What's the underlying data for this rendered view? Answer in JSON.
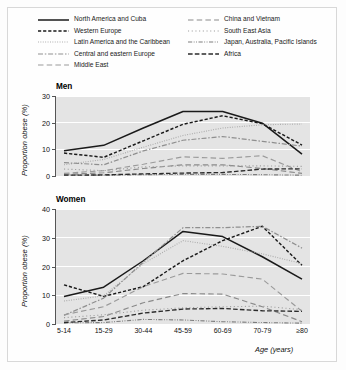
{
  "figure": {
    "background": "#fdfdfd",
    "plot_background": "#e4e4e4",
    "gridline_color": "#ffffff"
  },
  "legend": {
    "position": "top",
    "columns": [
      [
        {
          "label": "North America and Cuba",
          "style": "solid",
          "color": "#1a1a1a"
        },
        {
          "label": "Western Europe",
          "style": "dashed",
          "color": "#1a1a1a"
        },
        {
          "label": "Latin America and the Caribbean",
          "style": "dotted",
          "color": "#a9a9a9"
        },
        {
          "label": "Central and eastern Europe",
          "style": "dashdot",
          "color": "#8f8f8f"
        },
        {
          "label": "Middle East",
          "style": "longdash",
          "color": "#9a9a9a"
        }
      ],
      [
        {
          "label": "China and Vietnam",
          "style": "longdash",
          "color": "#8a8a8a"
        },
        {
          "label": "South East Asia",
          "style": "finedot",
          "color": "#9e9e9e"
        },
        {
          "label": "Japan, Australia, Pacific Islands",
          "style": "dashdotdot",
          "color": "#7d7d7d"
        },
        {
          "label": "Africa",
          "style": "dashdash",
          "color": "#2b2b2b"
        }
      ]
    ]
  },
  "chart_data": [
    {
      "type": "line",
      "title": "Men",
      "xlabel": "",
      "ylabel": "Proportion obese (%)",
      "categories": [
        "5-14",
        "15-29",
        "30-44",
        "45-59",
        "60-69",
        "70-79",
        "≥80"
      ],
      "ylim": [
        0,
        30
      ],
      "yticks": [
        0,
        10,
        20,
        30
      ],
      "grid": true,
      "series": [
        {
          "name": "North America and Cuba",
          "values": [
            9.5,
            11.5,
            18.0,
            24.2,
            24.2,
            19.8,
            8.2
          ]
        },
        {
          "name": "Western Europe",
          "values": [
            8.6,
            7.0,
            13.2,
            19.4,
            22.6,
            19.6,
            11.6
          ]
        },
        {
          "name": "Latin America and the Caribbean",
          "values": [
            4.2,
            6.2,
            10.8,
            15.2,
            18.0,
            19.2,
            19.5
          ]
        },
        {
          "name": "Central and eastern Europe",
          "values": [
            5.0,
            4.2,
            9.4,
            13.4,
            14.8,
            13.0,
            11.2
          ]
        },
        {
          "name": "Middle East",
          "values": [
            1.0,
            2.0,
            4.4,
            7.2,
            6.6,
            7.6,
            1.6
          ]
        },
        {
          "name": "China and Vietnam",
          "values": [
            0.6,
            1.2,
            2.8,
            4.2,
            4.2,
            2.8,
            1.0
          ]
        },
        {
          "name": "South East Asia",
          "values": [
            2.6,
            2.0,
            3.4,
            3.8,
            3.8,
            3.8,
            3.6
          ]
        },
        {
          "name": "Japan, Australia, Pacific Islands",
          "values": [
            0.4,
            0.3,
            0.5,
            0.6,
            0.6,
            0.5,
            0.3
          ]
        },
        {
          "name": "Africa",
          "values": [
            0.3,
            0.4,
            0.8,
            1.1,
            1.3,
            2.6,
            2.7
          ]
        }
      ]
    },
    {
      "type": "line",
      "title": "Women",
      "xlabel": "Age (years)",
      "ylabel": "Proportion obese (%)",
      "categories": [
        "5-14",
        "15-29",
        "30-44",
        "45-59",
        "60-69",
        "70-79",
        "≥80"
      ],
      "ylim": [
        0,
        40
      ],
      "yticks": [
        0,
        10,
        20,
        30,
        40
      ],
      "grid": true,
      "series": [
        {
          "name": "North America and Cuba",
          "values": [
            9.6,
            12.8,
            22.0,
            32.2,
            30.4,
            23.4,
            15.6
          ]
        },
        {
          "name": "Western Europe",
          "values": [
            13.6,
            9.6,
            13.0,
            22.0,
            29.0,
            34.0,
            20.4
          ]
        },
        {
          "name": "Latin America and the Caribbean",
          "values": [
            8.0,
            9.8,
            21.0,
            29.0,
            27.0,
            24.4,
            21.0
          ]
        },
        {
          "name": "Central and eastern Europe",
          "values": [
            3.0,
            9.0,
            21.5,
            33.5,
            33.5,
            34.0,
            26.4
          ]
        },
        {
          "name": "Middle East",
          "values": [
            3.2,
            6.0,
            13.0,
            17.6,
            17.4,
            15.6,
            4.4
          ]
        },
        {
          "name": "China and Vietnam",
          "values": [
            1.0,
            2.6,
            7.4,
            10.6,
            10.4,
            6.0,
            0.8
          ]
        },
        {
          "name": "South East Asia",
          "values": [
            2.2,
            3.2,
            4.8,
            5.6,
            6.0,
            6.2,
            5.0
          ]
        },
        {
          "name": "Japan, Australia, Pacific Islands",
          "values": [
            0.4,
            0.5,
            1.6,
            1.4,
            0.8,
            0.5,
            0.3
          ]
        },
        {
          "name": "Africa",
          "values": [
            0.5,
            1.4,
            3.8,
            5.2,
            5.4,
            4.6,
            4.4
          ]
        }
      ]
    }
  ]
}
